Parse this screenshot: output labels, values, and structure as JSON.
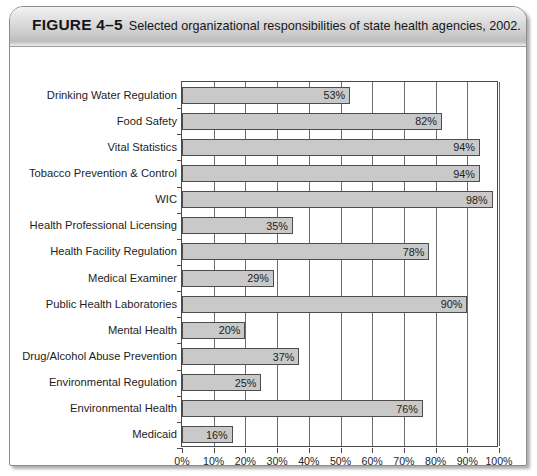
{
  "figure": {
    "number": "FIGURE 4–5",
    "caption": "Selected organizational responsibilities of state health agencies, 2002."
  },
  "chart_data": {
    "type": "bar",
    "orientation": "horizontal",
    "title": "Selected organizational responsibilities of state health agencies, 2002.",
    "xlabel": "",
    "ylabel": "",
    "xlim": [
      0,
      100
    ],
    "xticks": [
      "0%",
      "10%",
      "20%",
      "30%",
      "40%",
      "50%",
      "60%",
      "70%",
      "80%",
      "90%",
      "100%"
    ],
    "xtick_values": [
      0,
      10,
      20,
      30,
      40,
      50,
      60,
      70,
      80,
      90,
      100
    ],
    "grid": "vertical",
    "legend": "none",
    "bar_color": "#c9c9c9",
    "bar_border_color": "#4d4d4d",
    "categories": [
      "Drinking Water Regulation",
      "Food Safety",
      "Vital Statistics",
      "Tobacco Prevention & Control",
      "WIC",
      "Health Professional Licensing",
      "Health Facility Regulation",
      "Medical Examiner",
      "Public Health Laboratories",
      "Mental Health",
      "Drug/Alcohol Abuse Prevention",
      "Environmental Regulation",
      "Environmental Health",
      "Medicaid"
    ],
    "values": [
      53,
      82,
      94,
      94,
      98,
      35,
      78,
      29,
      90,
      20,
      37,
      25,
      76,
      16
    ],
    "value_labels": [
      "53%",
      "82%",
      "94%",
      "94%",
      "98%",
      "35%",
      "78%",
      "29%",
      "90%",
      "20%",
      "37%",
      "25%",
      "76%",
      "16%"
    ]
  }
}
